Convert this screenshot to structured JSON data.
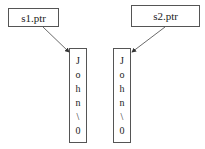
{
  "pointers": [
    {
      "label": "s1.ptr"
    },
    {
      "label": "s2.ptr"
    }
  ],
  "strings": [
    {
      "chars": [
        "J",
        "o",
        "h",
        "n",
        "\\",
        "0"
      ]
    },
    {
      "chars": [
        "J",
        "o",
        "h",
        "n",
        "\\",
        "0"
      ]
    }
  ]
}
